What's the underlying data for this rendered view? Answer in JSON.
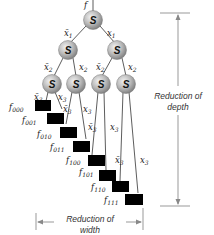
{
  "diagram": {
    "input_label": "f",
    "node_symbol": "S",
    "edge_labels": {
      "level1": {
        "left": "x̄",
        "left_sub": "1",
        "right": "x",
        "right_sub": "1"
      },
      "level2": [
        {
          "left": "x̄",
          "left_sub": "2",
          "right": "x",
          "right_sub": "2"
        },
        {
          "left": "x̄",
          "left_sub": "2",
          "right": "x",
          "right_sub": "2"
        }
      ],
      "level3": [
        {
          "left": "x̄",
          "left_sub": "3",
          "right": "x",
          "right_sub": "3"
        },
        {
          "left": "x̄",
          "left_sub": "3",
          "right": "x",
          "right_sub": "3"
        },
        {
          "left": "x̄",
          "left_sub": "3",
          "right": "x",
          "right_sub": "3"
        },
        {
          "left": "x̄",
          "left_sub": "3",
          "right": "x",
          "right_sub": "3"
        }
      ]
    },
    "leaves": [
      {
        "name": "f",
        "sub": "000"
      },
      {
        "name": "f",
        "sub": "001"
      },
      {
        "name": "f",
        "sub": "010"
      },
      {
        "name": "f",
        "sub": "011"
      },
      {
        "name": "f",
        "sub": "100"
      },
      {
        "name": "f",
        "sub": "101"
      },
      {
        "name": "f",
        "sub": "110"
      },
      {
        "name": "f",
        "sub": "111"
      }
    ],
    "depth_caption": [
      "Reduction of",
      "depth"
    ],
    "width_caption": [
      "Reduction of",
      "width"
    ],
    "colors": {
      "node_fill": "#b5b5b5",
      "leaf_fill": "#000000",
      "dimension_line": "#999999"
    }
  }
}
